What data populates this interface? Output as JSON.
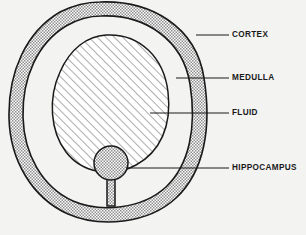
{
  "figure": {
    "type": "anatomical-cross-section-diagram",
    "title": "",
    "background_color": "#f3f3f1",
    "line_color": "#1a1a1a",
    "regions": [
      {
        "id": "cortex",
        "label": "CORTEX",
        "fill": "stipple-gray",
        "fill_color": "#b9b9b9",
        "description": "outer ring band"
      },
      {
        "id": "medulla",
        "label": "MEDULLA",
        "fill": "white",
        "fill_color": "#ffffff",
        "description": "white gap between outer ring and inner oval"
      },
      {
        "id": "fluid",
        "label": "FLUID",
        "fill": "diagonal-hatch",
        "fill_color": "#ffffff",
        "description": "hatched inner oval"
      },
      {
        "id": "hippocampus",
        "label": "HIPPOCAMPUS",
        "fill": "stipple-gray",
        "fill_color": "#b9b9b9",
        "description": "small stippled circle with stalk at bottom center"
      }
    ],
    "labels": [
      {
        "id": "cortex",
        "text": "CORTEX",
        "x": 232,
        "y": 35,
        "leader_from_x": 196,
        "leader_to_x": 229
      },
      {
        "id": "medulla",
        "text": "MEDULLA",
        "x": 232,
        "y": 78,
        "leader_from_x": 176,
        "leader_to_x": 229
      },
      {
        "id": "fluid",
        "text": "FLUID",
        "x": 232,
        "y": 113,
        "leader_from_x": 150,
        "leader_to_x": 229
      },
      {
        "id": "hippocampus",
        "text": "HIPPOCAMPUS",
        "x": 232,
        "y": 168,
        "leader_from_x": 126,
        "leader_to_x": 229
      }
    ]
  }
}
